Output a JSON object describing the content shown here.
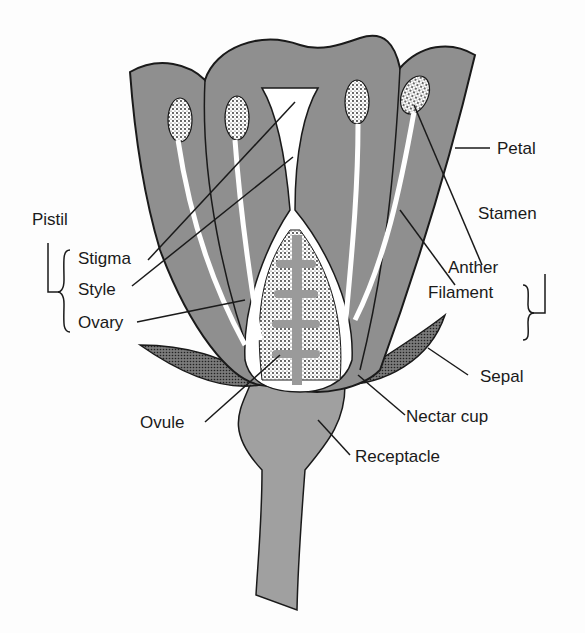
{
  "diagram": {
    "colors": {
      "petal": "#8f8f8f",
      "outline": "#1a1a1a",
      "white": "#ffffff",
      "receptacle": "#a0a0a0"
    },
    "labels": {
      "petal": "Petal",
      "stamen": "Stamen",
      "anther": "Anther",
      "filament": "Filament",
      "pistil": "Pistil",
      "stigma": "Stigma",
      "style": "Style",
      "ovary": "Ovary",
      "sepal": "Sepal",
      "ovule": "Ovule",
      "nectar_cup": "Nectar cup",
      "receptacle": "Receptacle"
    }
  }
}
